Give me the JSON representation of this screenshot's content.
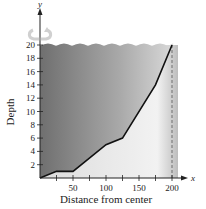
{
  "chart_data": {
    "type": "area",
    "title": "",
    "xlabel": "Distance from center",
    "ylabel": "Depth",
    "x_axis_var": "x",
    "y_axis_var": "y",
    "xlim": [
      0,
      210
    ],
    "ylim": [
      0,
      22
    ],
    "x_ticks": [
      25,
      50,
      75,
      100,
      125,
      150,
      175,
      200
    ],
    "x_tick_labels": [
      "",
      "50",
      "",
      "100",
      "",
      "150",
      "",
      "200"
    ],
    "y_ticks": [
      2,
      4,
      6,
      8,
      10,
      12,
      14,
      16,
      18,
      20
    ],
    "y_tick_labels": [
      "2",
      "4",
      "6",
      "8",
      "10",
      "12",
      "14",
      "16",
      "18",
      "20"
    ],
    "grid": false,
    "series": [
      {
        "name": "Bottom profile",
        "x": [
          0,
          25,
          50,
          100,
          125,
          175,
          200
        ],
        "y": [
          0,
          1,
          1,
          5,
          6,
          14,
          20
        ]
      }
    ],
    "annotations": [
      {
        "type": "dashed-vertical-line",
        "x": 200
      },
      {
        "type": "water-surface",
        "y": 20
      },
      {
        "type": "rotation-arrow",
        "about": "y-axis"
      }
    ]
  },
  "colors": {
    "water_dark": "#7a7a7a",
    "water_light": "#e6e6e6",
    "line": "#111111",
    "axis": "#222222"
  }
}
